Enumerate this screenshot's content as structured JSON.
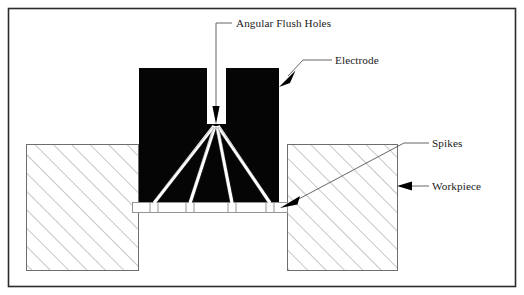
{
  "figure": {
    "frame": {
      "border_color": "#2b2b2b",
      "background": "#ffffff"
    },
    "colors": {
      "electrode_fill": "#050505",
      "workpiece_hatch": "#8a8a8a",
      "workpiece_outline": "#6e6e6e",
      "leader_line": "#555555",
      "arrow_fill": "#000000",
      "flush_channel": "#ffffff",
      "text": "#1a1a1a"
    },
    "labels": [
      {
        "id": "angular-flush-holes",
        "text": "Angular Flush Holes",
        "x": 236,
        "y": 27,
        "anchor": "start"
      },
      {
        "id": "electrode",
        "text": "Electrode",
        "x": 335,
        "y": 64,
        "anchor": "start"
      },
      {
        "id": "spikes",
        "text": "Spikes",
        "x": 432,
        "y": 147,
        "anchor": "start"
      },
      {
        "id": "workpiece",
        "text": "Workpiece",
        "x": 432,
        "y": 190,
        "anchor": "start"
      }
    ],
    "parts": {
      "electrode": {
        "name": "Electrode",
        "left": 139,
        "right": 279,
        "top": 68,
        "bottom": 202,
        "slot_left": 207,
        "slot_right": 226,
        "slot_bottom": 124
      },
      "workpiece_left": {
        "name": "Workpiece",
        "left": 26,
        "right": 139,
        "top": 144,
        "bottom": 271
      },
      "workpiece_right": {
        "name": "Workpiece",
        "left": 287,
        "right": 398,
        "top": 144,
        "bottom": 271
      },
      "spark_gap": {
        "name": "Spikes",
        "left": 132,
        "right": 288,
        "top": 202,
        "bottom": 212,
        "count": 4
      },
      "flush_channels": {
        "name": "Angular Flush Holes",
        "count": 4,
        "apex_x": 216,
        "apex_y": 124,
        "exit_x": [
          154,
          190,
          232,
          270
        ]
      }
    }
  }
}
